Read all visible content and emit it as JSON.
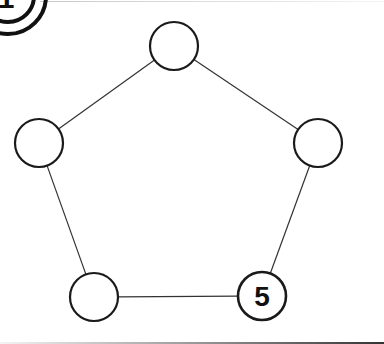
{
  "diagram": {
    "type": "pentagon-graph",
    "badge": {
      "label": "1",
      "cx": 8,
      "cy": -4,
      "r_inner": 26,
      "r_outer": 38
    },
    "node_radius": 24,
    "stroke_color": "#1a1a1a",
    "edge_color": "#333333",
    "nodes": [
      {
        "id": "top",
        "cx": 174,
        "cy": 46,
        "label": ""
      },
      {
        "id": "right",
        "cx": 318,
        "cy": 143,
        "label": ""
      },
      {
        "id": "bottom-right",
        "cx": 262,
        "cy": 296,
        "label": "5"
      },
      {
        "id": "bottom-left",
        "cx": 94,
        "cy": 297,
        "label": ""
      },
      {
        "id": "left",
        "cx": 39,
        "cy": 143,
        "label": ""
      }
    ],
    "edges": [
      [
        "top",
        "right"
      ],
      [
        "right",
        "bottom-right"
      ],
      [
        "bottom-right",
        "bottom-left"
      ],
      [
        "bottom-left",
        "left"
      ],
      [
        "left",
        "top"
      ]
    ]
  }
}
